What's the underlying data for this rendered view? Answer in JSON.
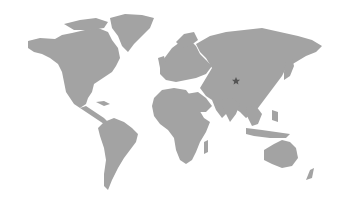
{
  "map": {
    "type": "world-map",
    "land_color": "#a3a3a3",
    "background_color": "#ffffff",
    "marker": {
      "icon": "star-icon",
      "color": "#555555",
      "region": "Central Asia (western China)",
      "x": 236,
      "y": 81
    }
  }
}
